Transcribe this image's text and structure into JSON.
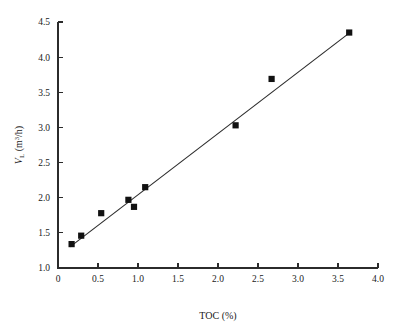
{
  "chart_data": {
    "type": "scatter",
    "title": "",
    "xlabel": "TOC (%)",
    "ylabel": "V_L (m3/h)",
    "ylabel_parts": {
      "symbol": "V",
      "subscript": "L",
      "units_open": " (m",
      "units_exponent": "3",
      "units_close": "/h)"
    },
    "xlim": [
      0,
      4.0
    ],
    "ylim": [
      1.0,
      4.5
    ],
    "grid": false,
    "legend": null,
    "xticks": [
      0,
      0.5,
      1.0,
      1.5,
      2.0,
      2.5,
      3.0,
      3.5,
      4.0
    ],
    "xticklabels": [
      "0",
      "0.5",
      "1.0",
      "1.5",
      "2.0",
      "2.5",
      "3.0",
      "3.5",
      "4.0"
    ],
    "yticks": [
      1.0,
      1.5,
      2.0,
      2.5,
      3.0,
      3.5,
      4.0,
      4.5
    ],
    "yticklabels": [
      "1.0",
      "1.5",
      "2.0",
      "2.5",
      "3.0",
      "3.5",
      "4.0",
      "4.5"
    ],
    "marker": "filled-square",
    "marker_color": "#111111",
    "line_color": "#2b2b2b",
    "points": [
      {
        "x": 0.17,
        "y": 1.34
      },
      {
        "x": 0.29,
        "y": 1.46
      },
      {
        "x": 0.54,
        "y": 1.78
      },
      {
        "x": 0.88,
        "y": 1.97
      },
      {
        "x": 0.95,
        "y": 1.87
      },
      {
        "x": 1.09,
        "y": 2.15
      },
      {
        "x": 2.22,
        "y": 3.03
      },
      {
        "x": 2.67,
        "y": 3.69
      },
      {
        "x": 3.64,
        "y": 4.35
      }
    ],
    "fit_line": {
      "x": [
        0.15,
        3.66
      ],
      "y": [
        1.3,
        4.36
      ]
    }
  }
}
